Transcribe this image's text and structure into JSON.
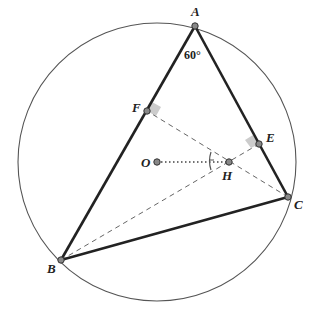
{
  "diagram": {
    "title": "",
    "circle": {
      "cx": 157,
      "cy": 162,
      "r": 139,
      "color": "#555555"
    },
    "points": {
      "A": {
        "x": 195,
        "y": 26,
        "label": "A",
        "lx": 191,
        "ly": 16
      },
      "B": {
        "x": 61,
        "y": 260,
        "label": "B",
        "lx": 47,
        "ly": 273
      },
      "C": {
        "x": 288,
        "y": 197,
        "label": "C",
        "lx": 294,
        "ly": 209
      },
      "E": {
        "x": 259,
        "y": 144,
        "label": "E",
        "lx": 266,
        "ly": 142
      },
      "F": {
        "x": 147,
        "y": 111,
        "label": "F",
        "lx": 132,
        "ly": 112
      },
      "H": {
        "x": 229,
        "y": 162,
        "label": "H",
        "lx": 222,
        "ly": 180
      },
      "O": {
        "x": 157,
        "y": 162,
        "label": "O",
        "lx": 141,
        "ly": 167
      }
    },
    "angle_label": {
      "text": "60°",
      "x": 184,
      "y": 59
    },
    "sides": [
      [
        "A",
        "B"
      ],
      [
        "A",
        "C"
      ],
      [
        "B",
        "C"
      ]
    ],
    "altitudes": [
      [
        "C",
        "F"
      ],
      [
        "B",
        "E"
      ]
    ],
    "dotted": [
      [
        "O",
        "H"
      ]
    ],
    "right_angle_marks": [
      "F",
      "E"
    ],
    "colors": {
      "stroke": "#222222",
      "dash": "#666666",
      "point_fill": "#888888",
      "mark_fill": "#cccccc"
    }
  }
}
